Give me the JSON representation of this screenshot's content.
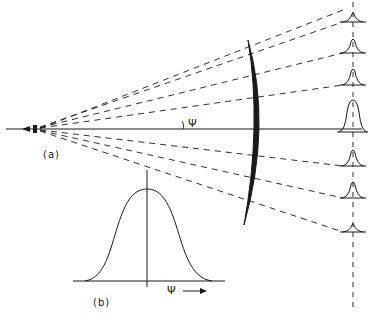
{
  "figure": {
    "panel_a": {
      "label": "(a)",
      "angle_symbol": "Ψ",
      "elements": [
        "source (left)",
        "diverging dashed rays (7)",
        "curved reflector/lens (crescent)",
        "vertical dashed detection axis",
        "bell-shaped intensity profiles at each ray"
      ],
      "profile_peaks_relative": [
        0.25,
        0.45,
        0.55,
        1.0,
        0.55,
        0.45,
        0.25
      ]
    },
    "panel_b": {
      "label": "(b)",
      "x_axis_symbol": "Ψ",
      "curve": "Gaussian-like bell curve centered on vertical axis"
    }
  },
  "colors": {
    "ink": "#1a1a1a",
    "background": "#ffffff"
  }
}
